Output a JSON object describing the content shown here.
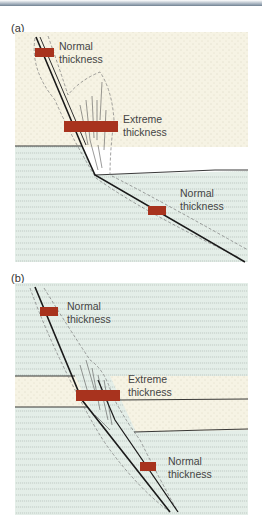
{
  "panels": [
    {
      "id": "a",
      "label": "(a)",
      "annotations": [
        {
          "line1": "Normal",
          "line2": "thickness"
        },
        {
          "line1": "Extreme",
          "line2": "thickness"
        },
        {
          "line1": "Normal",
          "line2": "thickness"
        }
      ]
    },
    {
      "id": "b",
      "label": "(b)",
      "annotations": [
        {
          "line1": "Normal",
          "line2": "thickness"
        },
        {
          "line1": "Extreme",
          "line2": "thickness"
        },
        {
          "line1": "Normal",
          "line2": "thickness"
        }
      ]
    }
  ],
  "colors": {
    "sandstone": "#f6f3e4",
    "shale": "#e4eee8",
    "bar": "#a8331e",
    "fault": "#1a1a1a"
  }
}
